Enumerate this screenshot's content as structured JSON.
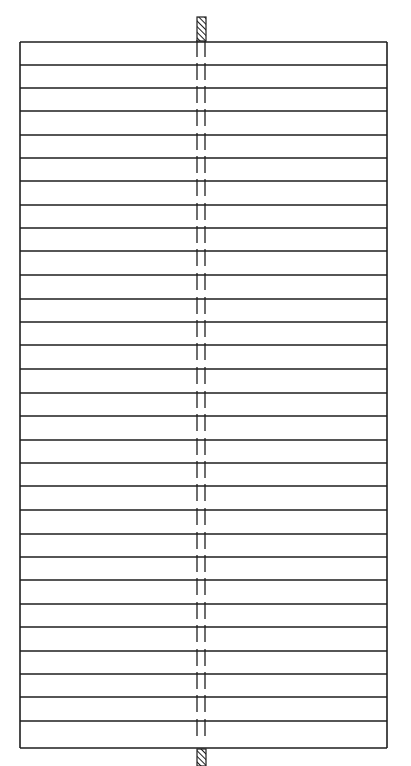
{
  "diagram": {
    "type": "stacked-plates-with-central-rod",
    "canvas": {
      "width": 411,
      "height": 766,
      "background": "#ffffff"
    },
    "stroke_color": "#1e1e1e",
    "frame": {
      "x1": 20,
      "x2": 387,
      "y_top": 42,
      "y_bottom": 748,
      "stroke_width": 1.6
    },
    "plate_count": 30,
    "plate_boundaries_y": [
      42,
      65,
      88,
      111,
      135,
      158,
      181,
      205,
      228,
      251,
      275,
      299,
      322,
      345,
      369,
      393,
      416,
      440,
      463,
      486,
      510,
      534,
      557,
      580,
      604,
      627,
      651,
      674,
      697,
      721,
      748
    ],
    "rod": {
      "left_x": 197,
      "right_x": 205,
      "stroke_width": 1.3,
      "dash_length": 15,
      "gap_length": 8,
      "style": "dashed-hidden-line"
    },
    "end_caps": [
      {
        "name": "top-cap",
        "x": 197,
        "y": 17,
        "width": 9,
        "height": 24,
        "fill": "hatched"
      },
      {
        "name": "bottom-cap",
        "x": 197,
        "y": 749,
        "width": 9,
        "height": 17,
        "fill": "hatched"
      }
    ]
  }
}
